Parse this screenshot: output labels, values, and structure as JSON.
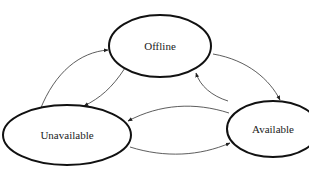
{
  "diagram": {
    "type": "state-transition",
    "nodes": [
      {
        "id": "offline",
        "label": "Offline"
      },
      {
        "id": "unavailable",
        "label": "Unavailable"
      },
      {
        "id": "available",
        "label": "Available"
      }
    ],
    "edges": [
      {
        "from": "unavailable",
        "to": "offline"
      },
      {
        "from": "offline",
        "to": "unavailable"
      },
      {
        "from": "offline",
        "to": "available"
      },
      {
        "from": "available",
        "to": "offline"
      },
      {
        "from": "available",
        "to": "unavailable"
      },
      {
        "from": "unavailable",
        "to": "available"
      }
    ],
    "colors": {
      "stroke": "#111111",
      "background": "#ffffff"
    }
  }
}
